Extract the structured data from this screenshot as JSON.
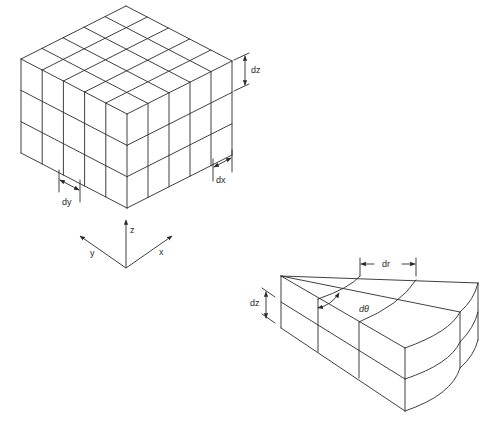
{
  "figure": {
    "cartesian_block": {
      "labels": {
        "dz": "dz",
        "dx": "dx",
        "dy": "dy"
      },
      "grid": {
        "columns_x": 5,
        "columns_y": 5,
        "layers_z": 3
      }
    },
    "axes": {
      "labels": {
        "z": "z",
        "y": "y",
        "x": "x"
      }
    },
    "cylindrical_block": {
      "labels": {
        "dr": "dr",
        "dtheta": "dθ",
        "dz": "dz"
      },
      "grid": {
        "radial_divisions": 3,
        "angular_divisions": 2,
        "layers_z": 2
      }
    }
  },
  "colors": {
    "line": "#2a2a2a",
    "background": "#ffffff"
  }
}
